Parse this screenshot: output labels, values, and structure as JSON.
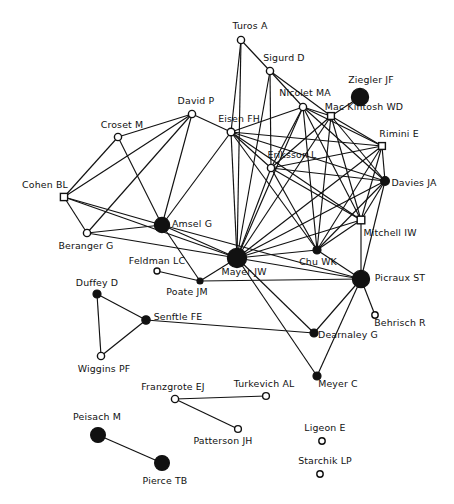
{
  "diagram": {
    "type": "network-graph",
    "title": "",
    "background_color": "#ffffff",
    "node_color_filled": "#111111",
    "node_color_open": "#ffffff",
    "edge_color": "#111111",
    "nodes": [
      {
        "id": "turos",
        "label": "Turos A",
        "x": 241,
        "y": 40,
        "r": 3.6,
        "shape": "circle",
        "filled": false,
        "lx": 250,
        "ly": 26
      },
      {
        "id": "sigurd",
        "label": "Sigurd D",
        "x": 270,
        "y": 71,
        "r": 3.6,
        "shape": "circle",
        "filled": false,
        "lx": 284,
        "ly": 58
      },
      {
        "id": "ziegler",
        "label": "Ziegler JF",
        "x": 360,
        "y": 97,
        "r": 8.6,
        "shape": "circle",
        "filled": true,
        "lx": 371,
        "ly": 80
      },
      {
        "id": "nicolet",
        "label": "Nicolet MA",
        "x": 303,
        "y": 107,
        "r": 3.6,
        "shape": "circle",
        "filled": false,
        "lx": 305,
        "ly": 93
      },
      {
        "id": "mackintosh",
        "label": "Mac Kintosh WD",
        "x": 331,
        "y": 116,
        "r": 3.4,
        "shape": "square",
        "filled": false,
        "lx": 364,
        "ly": 107
      },
      {
        "id": "david",
        "label": "David P",
        "x": 192,
        "y": 114,
        "r": 3.6,
        "shape": "circle",
        "filled": false,
        "lx": 196,
        "ly": 101
      },
      {
        "id": "eisen",
        "label": "Eisen FH",
        "x": 231,
        "y": 132,
        "r": 3.8,
        "shape": "circle",
        "filled": false,
        "lx": 239,
        "ly": 119
      },
      {
        "id": "croset",
        "label": "Croset M",
        "x": 118,
        "y": 137,
        "r": 3.6,
        "shape": "circle",
        "filled": false,
        "lx": 122,
        "ly": 125
      },
      {
        "id": "rimini",
        "label": "Rimini E",
        "x": 382,
        "y": 146,
        "r": 3.4,
        "shape": "square",
        "filled": false,
        "lx": 399,
        "ly": 134
      },
      {
        "id": "eriksson",
        "label": "Eriksson L",
        "x": 271,
        "y": 168,
        "r": 3.6,
        "shape": "circle",
        "filled": false,
        "lx": 292,
        "ly": 155
      },
      {
        "id": "davies",
        "label": "Davies JA",
        "x": 385,
        "y": 181,
        "r": 4.4,
        "shape": "circle",
        "filled": true,
        "lx": 414,
        "ly": 183
      },
      {
        "id": "cohen",
        "label": "Cohen BL",
        "x": 64,
        "y": 197,
        "r": 3.6,
        "shape": "square",
        "filled": false,
        "lx": 45,
        "ly": 185
      },
      {
        "id": "mitchell",
        "label": "Mitchell IW",
        "x": 361,
        "y": 220,
        "r": 3.8,
        "shape": "square",
        "filled": false,
        "lx": 390,
        "ly": 233
      },
      {
        "id": "amsel",
        "label": "Amsel G",
        "x": 162,
        "y": 225,
        "r": 7.6,
        "shape": "circle",
        "filled": true,
        "lx": 192,
        "ly": 224
      },
      {
        "id": "beranger",
        "label": "Beranger G",
        "x": 87,
        "y": 233,
        "r": 3.6,
        "shape": "circle",
        "filled": false,
        "lx": 86,
        "ly": 246
      },
      {
        "id": "chu",
        "label": "Chu WK",
        "x": 317,
        "y": 250,
        "r": 4.0,
        "shape": "circle",
        "filled": true,
        "lx": 318,
        "ly": 262
      },
      {
        "id": "mayer_jw",
        "label": "Mayer JW",
        "x": 237,
        "y": 258,
        "r": 9.6,
        "shape": "circle",
        "filled": true,
        "lx": 244,
        "ly": 272
      },
      {
        "id": "feldman",
        "label": "Feldman LC",
        "x": 157,
        "y": 271,
        "r": 3.0,
        "shape": "circle",
        "filled": false,
        "lx": 157,
        "ly": 261
      },
      {
        "id": "picraux",
        "label": "Picraux ST",
        "x": 361,
        "y": 279,
        "r": 8.6,
        "shape": "circle",
        "filled": true,
        "lx": 400,
        "ly": 278
      },
      {
        "id": "poate",
        "label": "Poate JM",
        "x": 200,
        "y": 281,
        "r": 3.0,
        "shape": "circle",
        "filled": true,
        "lx": 187,
        "ly": 292
      },
      {
        "id": "duffey",
        "label": "Duffey D",
        "x": 97,
        "y": 294,
        "r": 4.0,
        "shape": "circle",
        "filled": true,
        "lx": 97,
        "ly": 283
      },
      {
        "id": "behrisch",
        "label": "Behrisch R",
        "x": 375,
        "y": 315,
        "r": 3.2,
        "shape": "circle",
        "filled": false,
        "lx": 400,
        "ly": 323
      },
      {
        "id": "senftle",
        "label": "Senftle FE",
        "x": 146,
        "y": 320,
        "r": 4.2,
        "shape": "circle",
        "filled": true,
        "lx": 178,
        "ly": 317
      },
      {
        "id": "dearnaley",
        "label": "Dearnaley G",
        "x": 314,
        "y": 333,
        "r": 4.0,
        "shape": "circle",
        "filled": true,
        "lx": 348,
        "ly": 335
      },
      {
        "id": "wiggins",
        "label": "Wiggins PF",
        "x": 101,
        "y": 356,
        "r": 3.6,
        "shape": "circle",
        "filled": false,
        "lx": 104,
        "ly": 369
      },
      {
        "id": "meyer_c",
        "label": "Meyer C",
        "x": 317,
        "y": 376,
        "r": 4.0,
        "shape": "circle",
        "filled": true,
        "lx": 338,
        "ly": 384
      },
      {
        "id": "turkevich",
        "label": "Turkevich AL",
        "x": 266,
        "y": 396,
        "r": 3.4,
        "shape": "circle",
        "filled": false,
        "lx": 264,
        "ly": 384
      },
      {
        "id": "franzgrote",
        "label": "Franzgrote EJ",
        "x": 175,
        "y": 399,
        "r": 3.6,
        "shape": "circle",
        "filled": false,
        "lx": 173,
        "ly": 387
      },
      {
        "id": "patterson",
        "label": "Patterson JH",
        "x": 238,
        "y": 429,
        "r": 3.4,
        "shape": "circle",
        "filled": false,
        "lx": 223,
        "ly": 441
      },
      {
        "id": "peisach",
        "label": "Peisach M",
        "x": 98,
        "y": 435,
        "r": 7.4,
        "shape": "circle",
        "filled": true,
        "lx": 97,
        "ly": 417
      },
      {
        "id": "ligeon",
        "label": "Ligeon E",
        "x": 322,
        "y": 441,
        "r": 3.2,
        "shape": "circle",
        "filled": false,
        "lx": 325,
        "ly": 428
      },
      {
        "id": "starchik",
        "label": "Starchik LP",
        "x": 320,
        "y": 474,
        "r": 3.2,
        "shape": "circle",
        "filled": false,
        "lx": 325,
        "ly": 461
      },
      {
        "id": "pierce",
        "label": "Pierce TB",
        "x": 162,
        "y": 463,
        "r": 7.4,
        "shape": "circle",
        "filled": true,
        "lx": 165,
        "ly": 481
      }
    ],
    "edges": [
      [
        "turos",
        "eisen"
      ],
      [
        "turos",
        "sigurd"
      ],
      [
        "turos",
        "mayer_jw"
      ],
      [
        "sigurd",
        "nicolet"
      ],
      [
        "sigurd",
        "mayer_jw"
      ],
      [
        "sigurd",
        "eriksson"
      ],
      [
        "sigurd",
        "mackintosh"
      ],
      [
        "nicolet",
        "eisen"
      ],
      [
        "nicolet",
        "eriksson"
      ],
      [
        "nicolet",
        "mackintosh"
      ],
      [
        "nicolet",
        "mayer_jw"
      ],
      [
        "nicolet",
        "rimini"
      ],
      [
        "nicolet",
        "davies"
      ],
      [
        "nicolet",
        "mitchell"
      ],
      [
        "nicolet",
        "chu"
      ],
      [
        "ziegler",
        "mackintosh"
      ],
      [
        "mackintosh",
        "eriksson"
      ],
      [
        "mackintosh",
        "rimini"
      ],
      [
        "mackintosh",
        "davies"
      ],
      [
        "mackintosh",
        "mitchell"
      ],
      [
        "mackintosh",
        "mayer_jw"
      ],
      [
        "mackintosh",
        "chu"
      ],
      [
        "eisen",
        "eriksson"
      ],
      [
        "eisen",
        "rimini"
      ],
      [
        "eisen",
        "davies"
      ],
      [
        "eisen",
        "mitchell"
      ],
      [
        "eisen",
        "mayer_jw"
      ],
      [
        "eisen",
        "amsel"
      ],
      [
        "eisen",
        "chu"
      ],
      [
        "eisen",
        "david"
      ],
      [
        "eriksson",
        "rimini"
      ],
      [
        "eriksson",
        "davies"
      ],
      [
        "eriksson",
        "mitchell"
      ],
      [
        "eriksson",
        "mayer_jw"
      ],
      [
        "eriksson",
        "chu"
      ],
      [
        "rimini",
        "davies"
      ],
      [
        "rimini",
        "mitchell"
      ],
      [
        "rimini",
        "mayer_jw"
      ],
      [
        "rimini",
        "chu"
      ],
      [
        "davies",
        "mitchell"
      ],
      [
        "davies",
        "mayer_jw"
      ],
      [
        "davies",
        "chu"
      ],
      [
        "davies",
        "picraux"
      ],
      [
        "mitchell",
        "mayer_jw"
      ],
      [
        "mitchell",
        "chu"
      ],
      [
        "mitchell",
        "picraux"
      ],
      [
        "chu",
        "mayer_jw"
      ],
      [
        "chu",
        "picraux"
      ],
      [
        "david",
        "cohen"
      ],
      [
        "david",
        "croset"
      ],
      [
        "david",
        "amsel"
      ],
      [
        "david",
        "beranger"
      ],
      [
        "croset",
        "cohen"
      ],
      [
        "croset",
        "amsel"
      ],
      [
        "cohen",
        "beranger"
      ],
      [
        "cohen",
        "amsel"
      ],
      [
        "cohen",
        "mayer_jw"
      ],
      [
        "beranger",
        "amsel"
      ],
      [
        "beranger",
        "mayer_jw"
      ],
      [
        "amsel",
        "mayer_jw"
      ],
      [
        "amsel",
        "poate"
      ],
      [
        "amsel",
        "picraux"
      ],
      [
        "feldman",
        "poate"
      ],
      [
        "poate",
        "picraux"
      ],
      [
        "mayer_jw",
        "picraux"
      ],
      [
        "mayer_jw",
        "dearnaley"
      ],
      [
        "mayer_jw",
        "meyer_c"
      ],
      [
        "mayer_jw",
        "poate"
      ],
      [
        "picraux",
        "behrisch"
      ],
      [
        "picraux",
        "dearnaley"
      ],
      [
        "picraux",
        "meyer_c"
      ],
      [
        "senftle",
        "dearnaley"
      ],
      [
        "duffey",
        "senftle"
      ],
      [
        "duffey",
        "wiggins"
      ],
      [
        "wiggins",
        "senftle"
      ],
      [
        "franzgrote",
        "turkevich"
      ],
      [
        "franzgrote",
        "patterson"
      ],
      [
        "peisach",
        "pierce"
      ]
    ]
  }
}
